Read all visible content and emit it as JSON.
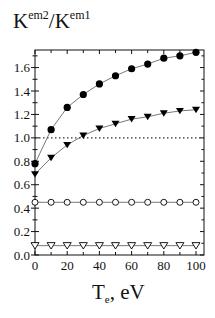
{
  "chart_data": {
    "type": "line",
    "title": "",
    "ylabel": {
      "base": "K",
      "sup1": "em2",
      "slash": "/K",
      "sup2": "em1"
    },
    "xlabel": {
      "base": "T",
      "sub": "e",
      "rest": ", eV"
    },
    "xlim": [
      0,
      105
    ],
    "ylim": [
      0,
      1.75
    ],
    "xticks": [
      0,
      20,
      40,
      60,
      80,
      100
    ],
    "yticks": [
      0.0,
      0.2,
      0.4,
      0.6,
      0.8,
      1.0,
      1.2,
      1.4,
      1.6
    ],
    "ytick_labels": [
      "0.0",
      "0.2",
      "0.4",
      "0.6",
      "0.8",
      "1.0",
      "1.2",
      "1.4",
      "1.6"
    ],
    "xtick_labels": [
      "0",
      "20",
      "40",
      "60",
      "80",
      "100"
    ],
    "grid": false,
    "legend": null,
    "reference_line": {
      "y": 1.0,
      "style": "dotted"
    },
    "x": [
      0,
      10,
      20,
      30,
      40,
      50,
      60,
      70,
      80,
      90,
      100
    ],
    "series": [
      {
        "name": "filled-circles",
        "marker": "circle-filled",
        "values": [
          0.78,
          1.07,
          1.26,
          1.37,
          1.46,
          1.53,
          1.59,
          1.63,
          1.68,
          1.7,
          1.73
        ]
      },
      {
        "name": "filled-triangles",
        "marker": "triangle-down-filled",
        "values": [
          0.69,
          0.83,
          0.94,
          1.02,
          1.08,
          1.12,
          1.16,
          1.18,
          1.21,
          1.23,
          1.24
        ]
      },
      {
        "name": "open-circles",
        "marker": "circle-open",
        "values": [
          0.45,
          0.45,
          0.45,
          0.45,
          0.45,
          0.45,
          0.45,
          0.45,
          0.45,
          0.45,
          0.45
        ]
      },
      {
        "name": "open-triangles",
        "marker": "triangle-down-open",
        "values": [
          0.08,
          0.08,
          0.08,
          0.08,
          0.08,
          0.08,
          0.08,
          0.08,
          0.08,
          0.08,
          0.08
        ]
      }
    ]
  },
  "colors": {
    "marker": "#000000",
    "line": "#555555",
    "axis": "#111111",
    "reference": "#333333"
  }
}
